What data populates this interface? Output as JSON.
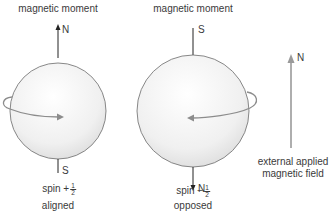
{
  "left": {
    "title": "magnetic moment",
    "top_pole": "N",
    "bottom_pole": "S",
    "spin_label": "spin +",
    "spin_num": "1",
    "spin_den": "2",
    "state": "aligned"
  },
  "middle": {
    "title": "magnetic moment",
    "top_pole": "S",
    "bottom_pole": "N",
    "spin_label": "spin −",
    "spin_num": "1",
    "spin_den": "2",
    "state": "opposed"
  },
  "field": {
    "pole": "N",
    "label_line1": "external applied",
    "label_line2": "magnetic field"
  },
  "colors": {
    "sphere_outline": "#6b6b6b",
    "spin_arrow": "#8c8c8c",
    "field_arrow": "#9a9a9a",
    "text": "#3a3a3a"
  }
}
